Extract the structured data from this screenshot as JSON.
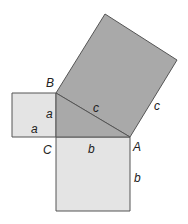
{
  "diagram": {
    "colors": {
      "small_square_fill": "#e4e4e4",
      "big_square_fill": "#a9a9a9",
      "triangle_fill": "#a9a9a9",
      "stroke": "#555555"
    },
    "vertices": {
      "B": "B",
      "C": "C",
      "A": "A"
    },
    "side_labels": {
      "a_vertical": "a",
      "a_horizontal": "a",
      "b_horizontal": "b",
      "b_vertical": "b",
      "c_hypotenuse": "c",
      "c_outer": "c"
    }
  }
}
